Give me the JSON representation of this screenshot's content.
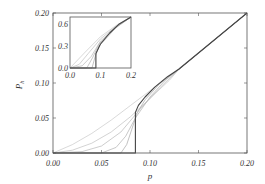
{
  "chart_data": [
    {
      "type": "line",
      "title": "",
      "xlabel": "p",
      "ylabel": "P_h",
      "xlim": [
        0.0,
        0.2
      ],
      "ylim": [
        0.0,
        0.2
      ],
      "grid": false,
      "legend": null,
      "x_ticks": [
        "0.00",
        "0.05",
        "0.10",
        "0.15",
        "0.20"
      ],
      "y_ticks": [
        "0.00",
        "0.05",
        "0.10",
        "0.15",
        "0.20"
      ],
      "series": [
        {
          "name": "curve-1",
          "color": "#c8c8c8",
          "x": [
            0.0,
            0.02,
            0.04,
            0.06,
            0.08,
            0.1,
            0.12,
            0.13,
            0.2
          ],
          "y": [
            0.0,
            0.012,
            0.028,
            0.047,
            0.068,
            0.089,
            0.11,
            0.121,
            0.2
          ]
        },
        {
          "name": "curve-2",
          "color": "#c0c0c0",
          "x": [
            0.0,
            0.02,
            0.04,
            0.06,
            0.08,
            0.1,
            0.12,
            0.13,
            0.2
          ],
          "y": [
            0.0,
            0.004,
            0.014,
            0.03,
            0.052,
            0.078,
            0.104,
            0.12,
            0.2
          ]
        },
        {
          "name": "curve-3",
          "color": "#b8b8b8",
          "x": [
            0.0,
            0.03,
            0.05,
            0.07,
            0.09,
            0.11,
            0.13,
            0.2
          ],
          "y": [
            0.0,
            0.002,
            0.01,
            0.03,
            0.063,
            0.093,
            0.12,
            0.2
          ]
        },
        {
          "name": "curve-4",
          "color": "#b0b0b0",
          "x": [
            0.0,
            0.05,
            0.065,
            0.075,
            0.085,
            0.1,
            0.115,
            0.13,
            0.2
          ],
          "y": [
            0.0,
            0.0,
            0.008,
            0.024,
            0.05,
            0.08,
            0.103,
            0.12,
            0.2
          ]
        },
        {
          "name": "curve-5",
          "color": "#a8a8a8",
          "x": [
            0.0,
            0.07,
            0.076,
            0.081,
            0.087,
            0.095,
            0.11,
            0.13,
            0.2
          ],
          "y": [
            0.0,
            0.0,
            0.012,
            0.033,
            0.058,
            0.076,
            0.099,
            0.12,
            0.2
          ]
        },
        {
          "name": "curve-critical",
          "color": "#444444",
          "x": [
            0.0,
            0.085,
            0.085,
            0.088,
            0.095,
            0.105,
            0.118,
            0.13,
            0.2
          ],
          "y": [
            0.0,
            0.0,
            0.058,
            0.068,
            0.08,
            0.094,
            0.109,
            0.12,
            0.2
          ]
        }
      ]
    },
    {
      "type": "line",
      "title": "inset",
      "xlabel": "",
      "ylabel": "",
      "xlim": [
        0.0,
        0.2
      ],
      "ylim": [
        0.0,
        0.7
      ],
      "grid": false,
      "x_ticks": [
        "0.0",
        "0.1",
        "0.2"
      ],
      "y_ticks": [
        "0.0",
        "0.3",
        "0.6"
      ],
      "series": [
        {
          "name": "inset-curve-1",
          "color": "#c8c8c8",
          "x": [
            0.0,
            0.05,
            0.1,
            0.15,
            0.2
          ],
          "y": [
            0.0,
            0.22,
            0.43,
            0.58,
            0.7
          ]
        },
        {
          "name": "inset-curve-2",
          "color": "#c0c0c0",
          "x": [
            0.0,
            0.03,
            0.06,
            0.1,
            0.15,
            0.2
          ],
          "y": [
            0.0,
            0.05,
            0.2,
            0.4,
            0.57,
            0.7
          ]
        },
        {
          "name": "inset-curve-3",
          "color": "#b8b8b8",
          "x": [
            0.0,
            0.04,
            0.07,
            0.1,
            0.15,
            0.2
          ],
          "y": [
            0.0,
            0.03,
            0.16,
            0.37,
            0.56,
            0.7
          ]
        },
        {
          "name": "inset-curve-4",
          "color": "#b0b0b0",
          "x": [
            0.0,
            0.055,
            0.075,
            0.095,
            0.15,
            0.2
          ],
          "y": [
            0.0,
            0.0,
            0.15,
            0.33,
            0.56,
            0.7
          ]
        },
        {
          "name": "inset-curve-5",
          "color": "#a8a8a8",
          "x": [
            0.0,
            0.072,
            0.082,
            0.095,
            0.15,
            0.2
          ],
          "y": [
            0.0,
            0.0,
            0.15,
            0.3,
            0.55,
            0.7
          ]
        },
        {
          "name": "inset-curve-critical",
          "color": "#444444",
          "x": [
            0.0,
            0.085,
            0.085,
            0.1,
            0.13,
            0.16,
            0.2
          ],
          "y": [
            0.0,
            0.0,
            0.2,
            0.33,
            0.48,
            0.6,
            0.7
          ]
        }
      ]
    }
  ],
  "main": {
    "xlabel": "p",
    "ylabel": "P",
    "ylabel_sub": "h",
    "x_ticks": [
      "0.00",
      "0.05",
      "0.10",
      "0.15",
      "0.20"
    ],
    "y_ticks": [
      "0.00",
      "0.05",
      "0.10",
      "0.15",
      "0.20"
    ]
  },
  "inset": {
    "x_ticks": [
      "0.0",
      "0.1",
      "0.2"
    ],
    "y_ticks": [
      "0.0",
      "0.3",
      "0.6"
    ]
  }
}
